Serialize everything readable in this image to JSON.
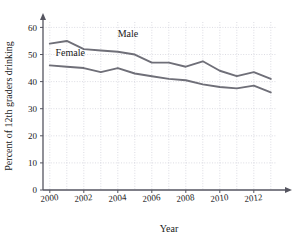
{
  "chart_data": {
    "type": "line",
    "title": "",
    "xlabel": "Year",
    "ylabel": "Percent of 12th graders drinking",
    "x": [
      2000,
      2001,
      2002,
      2003,
      2004,
      2005,
      2006,
      2007,
      2008,
      2009,
      2010,
      2011,
      2012,
      2013
    ],
    "xlim": [
      1999.6,
      2013.6
    ],
    "ylim": [
      0,
      62
    ],
    "xticks": [
      2000,
      2002,
      2004,
      2006,
      2008,
      2010,
      2012
    ],
    "xtick_labels": [
      "2000",
      "2002",
      "2004",
      "2006",
      "2008",
      "2010",
      "2012"
    ],
    "yticks": [
      0,
      10,
      20,
      30,
      40,
      50,
      60
    ],
    "ytick_labels": [
      "0",
      "10",
      "20",
      "30",
      "40",
      "50",
      "60"
    ],
    "grid": true,
    "grid_color": "#b9b9c6",
    "legend_position": "inline-annotations",
    "series": [
      {
        "name": "Male",
        "color": "#6f6f78",
        "label_x": 2004.6,
        "label_y": 56.5,
        "values": [
          54,
          55,
          52,
          51.5,
          51,
          50,
          47,
          47,
          45.5,
          47.5,
          44,
          42,
          43.5,
          41
        ]
      },
      {
        "name": "Female",
        "color": "#6f6f78",
        "label_x": 2001.2,
        "label_y": 49.5,
        "values": [
          46,
          45.5,
          45,
          43.5,
          45,
          43,
          42,
          41,
          40.5,
          39,
          38,
          37.5,
          38.5,
          36
        ]
      }
    ]
  },
  "axes": {
    "x_axis_title": "Year",
    "y_axis_title": "Percent of 12th graders drinking"
  }
}
